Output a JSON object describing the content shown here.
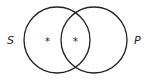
{
  "diagram": {
    "type": "venn",
    "sets": [
      {
        "label": "S",
        "cx": 57,
        "cy": 40,
        "r": 33
      },
      {
        "label": "P",
        "cx": 94,
        "cy": 40,
        "r": 33
      }
    ],
    "marks": [
      {
        "region": "S-only",
        "symbol": "*",
        "x": 48,
        "y": 44
      },
      {
        "region": "S-and-P",
        "symbol": "*",
        "x": 76,
        "y": 44
      }
    ],
    "stroke_color": "#222222"
  }
}
